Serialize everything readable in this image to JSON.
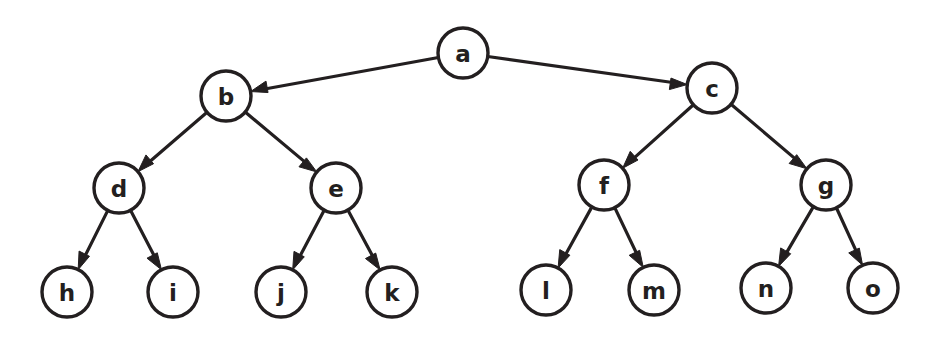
{
  "diagram": {
    "type": "directed-tree",
    "width": 935,
    "height": 339,
    "background_color": "#ffffff",
    "stroke_color": "#231f20",
    "node_fill": "#ffffff",
    "node_radius": 25,
    "edge_style": "straight-arrow",
    "arrow_direction": "parent-to-child",
    "nodes": [
      {
        "id": "a",
        "label": "a",
        "cx": 463,
        "cy": 53,
        "level": 0
      },
      {
        "id": "b",
        "label": "b",
        "cx": 226,
        "cy": 96,
        "level": 1
      },
      {
        "id": "c",
        "label": "c",
        "cx": 712,
        "cy": 88,
        "level": 1
      },
      {
        "id": "d",
        "label": "d",
        "cx": 119,
        "cy": 188,
        "level": 2
      },
      {
        "id": "e",
        "label": "e",
        "cx": 336,
        "cy": 188,
        "level": 2
      },
      {
        "id": "f",
        "label": "f",
        "cx": 604,
        "cy": 185,
        "level": 2
      },
      {
        "id": "g",
        "label": "g",
        "cx": 826,
        "cy": 185,
        "level": 2
      },
      {
        "id": "h",
        "label": "h",
        "cx": 67,
        "cy": 292,
        "level": 3
      },
      {
        "id": "i",
        "label": "i",
        "cx": 173,
        "cy": 292,
        "level": 3
      },
      {
        "id": "j",
        "label": "j",
        "cx": 281,
        "cy": 292,
        "level": 3
      },
      {
        "id": "k",
        "label": "k",
        "cx": 392,
        "cy": 292,
        "level": 3
      },
      {
        "id": "l",
        "label": "l",
        "cx": 546,
        "cy": 290,
        "level": 3
      },
      {
        "id": "m",
        "label": "m",
        "cx": 654,
        "cy": 290,
        "level": 3
      },
      {
        "id": "n",
        "label": "n",
        "cx": 766,
        "cy": 288,
        "level": 3
      },
      {
        "id": "o",
        "label": "o",
        "cx": 873,
        "cy": 288,
        "level": 3
      }
    ],
    "edges": [
      {
        "from": "a",
        "to": "b"
      },
      {
        "from": "a",
        "to": "c"
      },
      {
        "from": "b",
        "to": "d"
      },
      {
        "from": "b",
        "to": "e"
      },
      {
        "from": "c",
        "to": "f"
      },
      {
        "from": "c",
        "to": "g"
      },
      {
        "from": "d",
        "to": "h"
      },
      {
        "from": "d",
        "to": "i"
      },
      {
        "from": "e",
        "to": "j"
      },
      {
        "from": "e",
        "to": "k"
      },
      {
        "from": "f",
        "to": "l"
      },
      {
        "from": "f",
        "to": "m"
      },
      {
        "from": "g",
        "to": "n"
      },
      {
        "from": "g",
        "to": "o"
      }
    ]
  }
}
